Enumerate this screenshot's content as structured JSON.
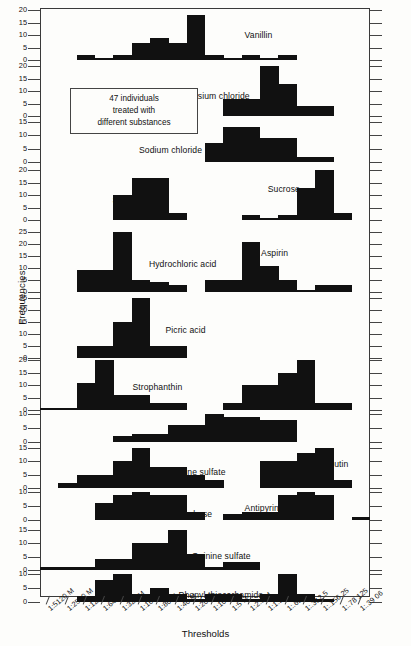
{
  "figure": {
    "ylabel": "Frequencies",
    "xlabel": "Thresholds",
    "note_lines": [
      "47 individuals",
      "treated with",
      "different substances"
    ]
  },
  "chart_data": {
    "type": "bar",
    "title": "",
    "xlabel": "Thresholds",
    "ylabel": "Frequencies",
    "annotation": "47 individuals treated with different substances",
    "grid": false,
    "legend": "none",
    "n_individuals": 47,
    "categories": [
      "1:5120 M",
      "1:2560 M",
      "1:1280 M",
      "1:640 M",
      "1:320 M",
      "1:160 M",
      "1:80 M",
      "1:40 M",
      "1:20 M",
      "1:10 M",
      "1:5 M",
      "1:2.5 M",
      "1:1.25 M",
      "1:.625",
      "1:.312 5",
      "1:.156 25",
      "1:.78 125",
      "1:.39 06"
    ],
    "panels": [
      {
        "name": "Vanillin",
        "label": "Vanillin",
        "ylim": [
          0,
          20
        ],
        "yticks": [
          0,
          5,
          10,
          15,
          20
        ],
        "label_x_frac": 0.62,
        "label_y_frac": 0.52,
        "values": [
          0,
          0,
          2,
          1,
          2,
          7,
          9,
          7,
          18,
          2,
          1,
          2,
          1,
          2,
          0,
          0,
          0,
          0
        ]
      },
      {
        "name": "Potassium chloride",
        "label": "Potassium chloride",
        "ylim": [
          0,
          20
        ],
        "yticks": [
          0,
          5,
          10,
          15,
          20
        ],
        "label_x_frac": 0.41,
        "label_y_frac": 0.62,
        "values": [
          0,
          0,
          0,
          0,
          0,
          0,
          0,
          0,
          0,
          0,
          7,
          7,
          22,
          13,
          4,
          4,
          0,
          0
        ]
      },
      {
        "name": "Sodium chloride",
        "label": "Sodium chloride",
        "ylim": [
          0,
          15
        ],
        "yticks": [
          0,
          5,
          10,
          15
        ],
        "label_x_frac": 0.3,
        "label_y_frac": 0.72,
        "values": [
          0,
          0,
          0,
          0,
          0,
          0,
          0,
          0,
          0,
          7,
          13,
          13,
          9,
          9,
          2,
          2,
          0,
          0
        ]
      },
      {
        "name": "Saccharine and Sucrose",
        "label": "Saccharine",
        "label2": "Sucrose",
        "ylim": [
          0,
          20
        ],
        "yticks": [
          0,
          5,
          10,
          15,
          20
        ],
        "label_x_frac": 0.22,
        "label_y_frac": 0.62,
        "label2_x_frac": 0.69,
        "label2_y_frac": 0.4,
        "values": [
          0,
          0,
          0,
          0,
          10,
          17,
          17,
          3,
          0,
          0,
          0,
          2,
          1,
          2,
          13,
          21,
          3,
          0
        ]
      },
      {
        "name": "Hydrochloric acid and Aspirin",
        "label": "Hydrochloric acid",
        "label2": "Aspirin",
        "ylim": [
          0,
          25
        ],
        "yticks": [
          0,
          5,
          10,
          15,
          20,
          25
        ],
        "label_x_frac": 0.33,
        "label_y_frac": 0.55,
        "label2_x_frac": 0.67,
        "label2_y_frac": 0.36,
        "values": [
          0,
          0,
          9,
          9,
          27,
          5,
          4,
          3,
          0,
          5,
          5,
          21,
          11,
          5,
          1,
          3,
          3,
          0
        ]
      },
      {
        "name": "Picric acid",
        "label": "Picric acid",
        "ylim": [
          0,
          25
        ],
        "yticks": [
          0,
          5,
          10,
          15,
          20,
          25
        ],
        "label_x_frac": 0.38,
        "label_y_frac": 0.55,
        "values": [
          0,
          0,
          5,
          5,
          15,
          25,
          5,
          5,
          0,
          0,
          0,
          0,
          0,
          0,
          0,
          0,
          0,
          0
        ]
      },
      {
        "name": "Strophanthin and Esculin",
        "label": "Strophanthin",
        "label2": "Esculin",
        "ylim": [
          0,
          20
        ],
        "yticks": [
          0,
          5,
          10,
          15,
          20
        ],
        "label_x_frac": 0.28,
        "label_y_frac": 0.55,
        "label2_x_frac": 0.69,
        "label2_y_frac": 0.8,
        "values": [
          1,
          1,
          11,
          24,
          6,
          6,
          3,
          3,
          0,
          0,
          3,
          10,
          10,
          15,
          22,
          3,
          3,
          0
        ]
      },
      {
        "name": "Cascara",
        "label": "Cascara",
        "ylim": [
          0,
          10
        ],
        "yticks": [
          0,
          5,
          10
        ],
        "label_x_frac": 0.54,
        "label_y_frac": 0.9,
        "values": [
          0,
          0,
          0,
          0,
          2,
          3,
          3,
          6,
          6,
          12,
          9,
          9,
          8,
          8,
          0,
          0,
          0,
          0
        ]
      },
      {
        "name": "Strychnine sulfate and Arbutin",
        "label": "Strychnine sulfate",
        "label2": "Arbutin",
        "ylim": [
          0,
          15
        ],
        "yticks": [
          0,
          5,
          10,
          15
        ],
        "label_x_frac": 0.35,
        "label_y_frac": 0.62,
        "label2_x_frac": 0.85,
        "label2_y_frac": 0.42,
        "values": [
          0,
          2,
          5,
          5,
          10,
          18,
          8,
          8,
          5,
          3,
          0,
          0,
          10,
          10,
          13,
          16,
          3,
          0
        ]
      },
      {
        "name": "Optochin base and Antipyrine",
        "label": "Optochin base",
        "label2": "Antipyrine",
        "ylim": [
          0,
          10
        ],
        "yticks": [
          0,
          5,
          10
        ],
        "label_x_frac": 0.35,
        "label_y_frac": 0.82,
        "label2_x_frac": 0.62,
        "label2_y_frac": 0.6,
        "values": [
          0,
          0,
          0,
          6,
          9,
          12,
          9,
          9,
          3,
          0,
          2,
          3,
          3,
          9,
          12,
          9,
          0,
          1
        ]
      },
      {
        "name": "Quinine sulfate",
        "label": "Quinine sulfate",
        "ylim": [
          0,
          15
        ],
        "yticks": [
          0,
          5,
          10,
          15
        ],
        "label_x_frac": 0.46,
        "label_y_frac": 0.68,
        "values": [
          1,
          1,
          1,
          4,
          4,
          10,
          10,
          16,
          6,
          1,
          3,
          3,
          0,
          0,
          0,
          0,
          0,
          0
        ]
      },
      {
        "name": "Phenyl thiocarbamide",
        "label": "Phenyl thiocarbamide",
        "ylim": [
          0,
          10
        ],
        "yticks": [
          0,
          5,
          10
        ],
        "label_x_frac": 0.42,
        "label_y_frac": 0.78,
        "values": [
          0,
          0,
          2,
          8,
          11,
          3,
          5,
          3,
          1,
          3,
          3,
          1,
          3,
          10,
          3,
          1,
          0,
          0
        ]
      }
    ]
  }
}
